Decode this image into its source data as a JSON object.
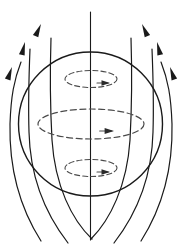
{
  "figure": {
    "name": "dipole-magnetic-field-diagram",
    "title": "",
    "caption": "",
    "width": 181,
    "height": 246,
    "background_color": "#ffffff",
    "line_color": "#1a1a1a",
    "dashed_line_color": "#4a4a4a"
  },
  "sphere": {
    "label": "",
    "center_x": 90.5,
    "center_y": 124,
    "radius": 72,
    "stroke_width": 1.4,
    "style": "solid"
  },
  "rotation_axis": {
    "label": "",
    "x": 90.5,
    "y_top": 12,
    "y_bottom": 240,
    "stroke_width": 1.1,
    "style": "solid"
  },
  "current_loops": [
    {
      "name": "upper-current-loop",
      "center_x": 91,
      "center_y": 79,
      "radius_x": 26,
      "radius_y": 8.5,
      "style": "dashed",
      "dash_pattern": "5,3",
      "stroke_width": 1.1,
      "arrow": {
        "x": 110,
        "y": 83,
        "direction": "right",
        "size": 5
      }
    },
    {
      "name": "equatorial-current-loop",
      "center_x": 91,
      "center_y": 124,
      "radius_x": 53,
      "radius_y": 15,
      "style": "dashed",
      "dash_pattern": "6,3.5",
      "stroke_width": 1.2,
      "arrow": {
        "x": 114,
        "y": 131,
        "direction": "right",
        "size": 5.5
      }
    },
    {
      "name": "lower-current-loop",
      "center_x": 91,
      "center_y": 168,
      "radius_x": 26,
      "radius_y": 8.5,
      "style": "dashed",
      "dash_pattern": "5,3",
      "stroke_width": 1.1,
      "arrow": {
        "x": 110,
        "y": 172,
        "direction": "right",
        "size": 5
      }
    }
  ],
  "field_lines": [
    {
      "name": "field-line-left-outer",
      "side": "left",
      "path": "M 41 241 C 20 208, 9 170, 10 124 C 11 96, 14 80, 21 62",
      "stroke_width": 1.2,
      "arrow": {
        "x": 12,
        "y": 67,
        "angle": -71,
        "size": 7
      }
    },
    {
      "name": "field-line-left-middle",
      "side": "left",
      "path": "M 68 243 C 44 212, 30 175, 29 132 C 28 100, 29 74, 30 49",
      "stroke_width": 1.2,
      "arrow": {
        "x": 25,
        "y": 42,
        "angle": -76,
        "size": 7
      }
    },
    {
      "name": "field-line-left-inner",
      "side": "left",
      "path": "M 92 239 C 72 220, 55 186, 52 140 C 50 104, 50 70, 51 38",
      "stroke_width": 1.2,
      "arrow": {
        "x": 41,
        "y": 24,
        "angle": -66,
        "size": 7
      }
    },
    {
      "name": "field-line-right-inner",
      "side": "right",
      "path": "M 91 239 C 110 220, 127 186, 130 140 C 132 104, 132 70, 131 38",
      "stroke_width": 1.2,
      "arrow": {
        "x": 142,
        "y": 24,
        "angle": -114,
        "size": 7
      }
    },
    {
      "name": "field-line-right-middle",
      "side": "right",
      "path": "M 114 243 C 138 212, 152 175, 153 132 C 154 100, 153 74, 152 49",
      "stroke_width": 1.2,
      "arrow": {
        "x": 157,
        "y": 42,
        "angle": -104,
        "size": 7
      }
    },
    {
      "name": "field-line-right-outer",
      "side": "right",
      "path": "M 141 241 C 162 208, 173 170, 172 124 C 171 96, 168 80, 161 62",
      "stroke_width": 1.2,
      "arrow": {
        "x": 170,
        "y": 67,
        "angle": -109,
        "size": 7
      }
    }
  ],
  "chart_data": {
    "type": "diagram",
    "subtype": "vector-field-schematic",
    "title": "",
    "description_elements": [
      "sphere-outline",
      "rotation-axis",
      "upper-current-loop",
      "equatorial-current-loop",
      "lower-current-loop",
      "six-magnetic-field-lines"
    ],
    "field_line_count": 6,
    "current_loop_count": 3,
    "axis_label": "",
    "legend": []
  }
}
